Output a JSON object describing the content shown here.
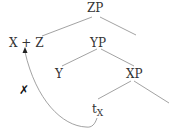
{
  "diagram": {
    "type": "syntax-tree",
    "nodes": {
      "root": "ZP",
      "left_of_root": "X + Z",
      "right_of_root": "YP",
      "yp_left": "Y",
      "yp_right": "XP",
      "trace": "t",
      "trace_subscript": "X"
    },
    "movement_mark": "✗",
    "colors": {
      "line": "#8a8a8a",
      "text": "#333333"
    }
  }
}
